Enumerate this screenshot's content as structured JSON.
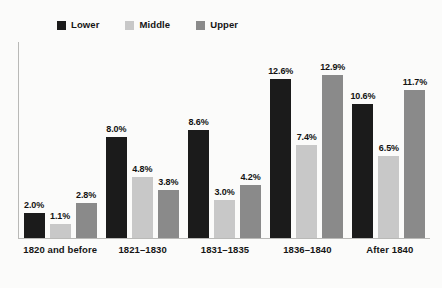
{
  "chart_data": {
    "type": "bar",
    "title": "",
    "subtitle": "",
    "xlabel": "",
    "ylabel": "",
    "ylim": [
      0,
      14.5
    ],
    "grid": false,
    "legend_position": "top-left",
    "categories": [
      "1820 and before",
      "1821–1830",
      "1831–1835",
      "1836–1840",
      "After 1840"
    ],
    "series": [
      {
        "name": "Lower",
        "color": "#1b1b1b",
        "values": [
          2.0,
          8.0,
          8.6,
          12.6,
          10.6
        ],
        "labels": [
          "2.0%",
          "8.0%",
          "8.6%",
          "12.6%",
          "10.6%"
        ]
      },
      {
        "name": "Middle",
        "color": "#c8c8c8",
        "values": [
          1.1,
          4.8,
          3.0,
          7.4,
          6.5
        ],
        "labels": [
          "1.1%",
          "4.8%",
          "3.0%",
          "7.4%",
          "6.5%"
        ]
      },
      {
        "name": "Upper",
        "color": "#8a8a8a",
        "values": [
          2.8,
          3.8,
          4.2,
          12.9,
          11.7
        ],
        "labels": [
          "2.8%",
          "3.8%",
          "4.2%",
          "12.9%",
          "11.7%"
        ]
      }
    ]
  },
  "legend": {
    "items": [
      {
        "label": "Lower",
        "color": "#1b1b1b"
      },
      {
        "label": "Middle",
        "color": "#c8c8c8"
      },
      {
        "label": "Upper",
        "color": "#8a8a8a"
      }
    ]
  },
  "colors": {
    "background": "#fbfbfa",
    "axis": "#b9b9b7",
    "text": "#151515"
  }
}
